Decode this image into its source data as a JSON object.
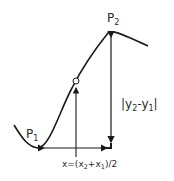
{
  "diagram": {
    "points": {
      "p1": {
        "label": "P",
        "sub": "1"
      },
      "p2": {
        "label": "P",
        "sub": "2"
      }
    },
    "vertical_label": {
      "bar_left": "|",
      "y2": "y",
      "y2_sub": "2",
      "minus": "-",
      "y1": "y",
      "y1_sub": "1",
      "bar_right": "|"
    },
    "midpoint_label": {
      "prefix": "x=(x",
      "sub2": "2",
      "plus": "+x",
      "sub1": "1",
      "suffix": ")/2"
    },
    "colors": {
      "stroke": "#1a1a1a",
      "background": "#ffffff"
    }
  }
}
